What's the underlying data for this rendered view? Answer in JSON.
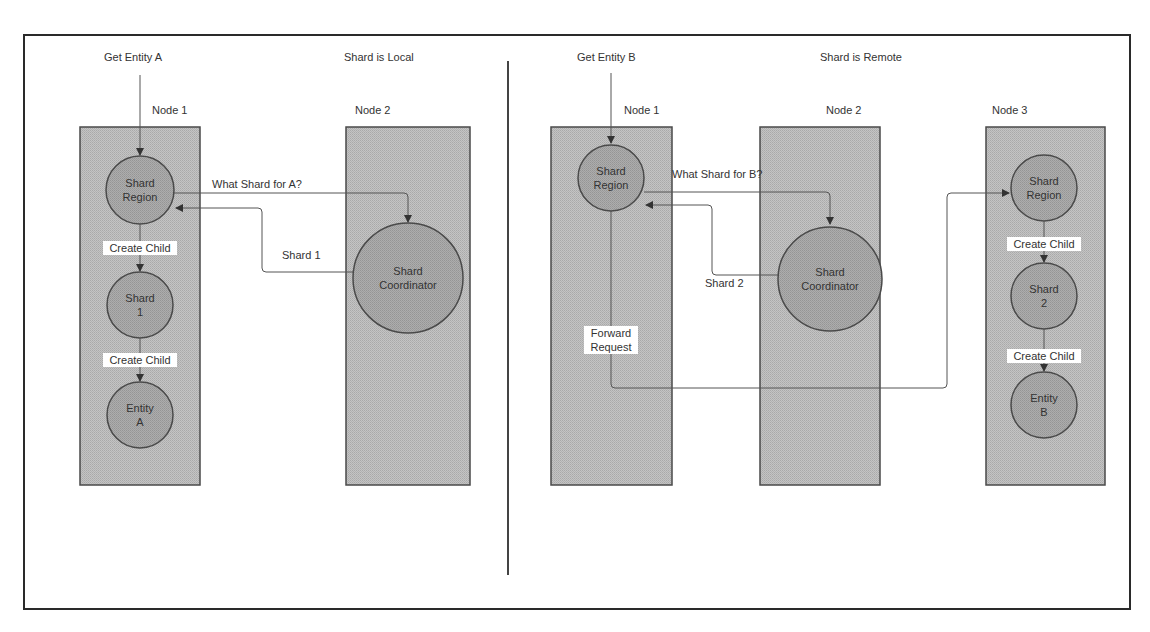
{
  "diagram": {
    "type": "sharding-request-flow",
    "colors": {
      "frame": "#2a2a2a",
      "node_fill": "#bdbdbd",
      "node_border": "#4a4a4a",
      "actor_fill": "#a6a6a6",
      "actor_border": "#4a4a4a",
      "arrow": "#555555",
      "label_bg": "#ffffff",
      "text": "#333333"
    },
    "left": {
      "request_label": "Get Entity A",
      "scenario_label": "Shard is Local",
      "nodes": [
        {
          "id": "node1",
          "label": "Node 1"
        },
        {
          "id": "node2",
          "label": "Node 2"
        }
      ],
      "actors": {
        "shard_region": {
          "line1": "Shard",
          "line2": "Region"
        },
        "shard": {
          "line1": "Shard",
          "line2": "1"
        },
        "entity": {
          "line1": "Entity",
          "line2": "A"
        },
        "coordinator": {
          "line1": "Shard",
          "line2": "Coordinator"
        }
      },
      "messages": {
        "query": "What Shard for A?",
        "reply": "Shard 1",
        "create_child_1": "Create Child",
        "create_child_2": "Create Child"
      }
    },
    "right": {
      "request_label": "Get Entity B",
      "scenario_label": "Shard is Remote",
      "nodes": [
        {
          "id": "node1",
          "label": "Node 1"
        },
        {
          "id": "node2",
          "label": "Node 2"
        },
        {
          "id": "node3",
          "label": "Node 3"
        }
      ],
      "actors": {
        "shard_region_n1": {
          "line1": "Shard",
          "line2": "Region"
        },
        "coordinator": {
          "line1": "Shard",
          "line2": "Coordinator"
        },
        "shard_region_n3": {
          "line1": "Shard",
          "line2": "Region"
        },
        "shard": {
          "line1": "Shard",
          "line2": "2"
        },
        "entity": {
          "line1": "Entity",
          "line2": "B"
        }
      },
      "messages": {
        "query": "What Shard for B?",
        "reply": "Shard 2",
        "forward_line1": "Forward",
        "forward_line2": "Request",
        "create_child_1": "Create Child",
        "create_child_2": "Create Child"
      }
    }
  }
}
